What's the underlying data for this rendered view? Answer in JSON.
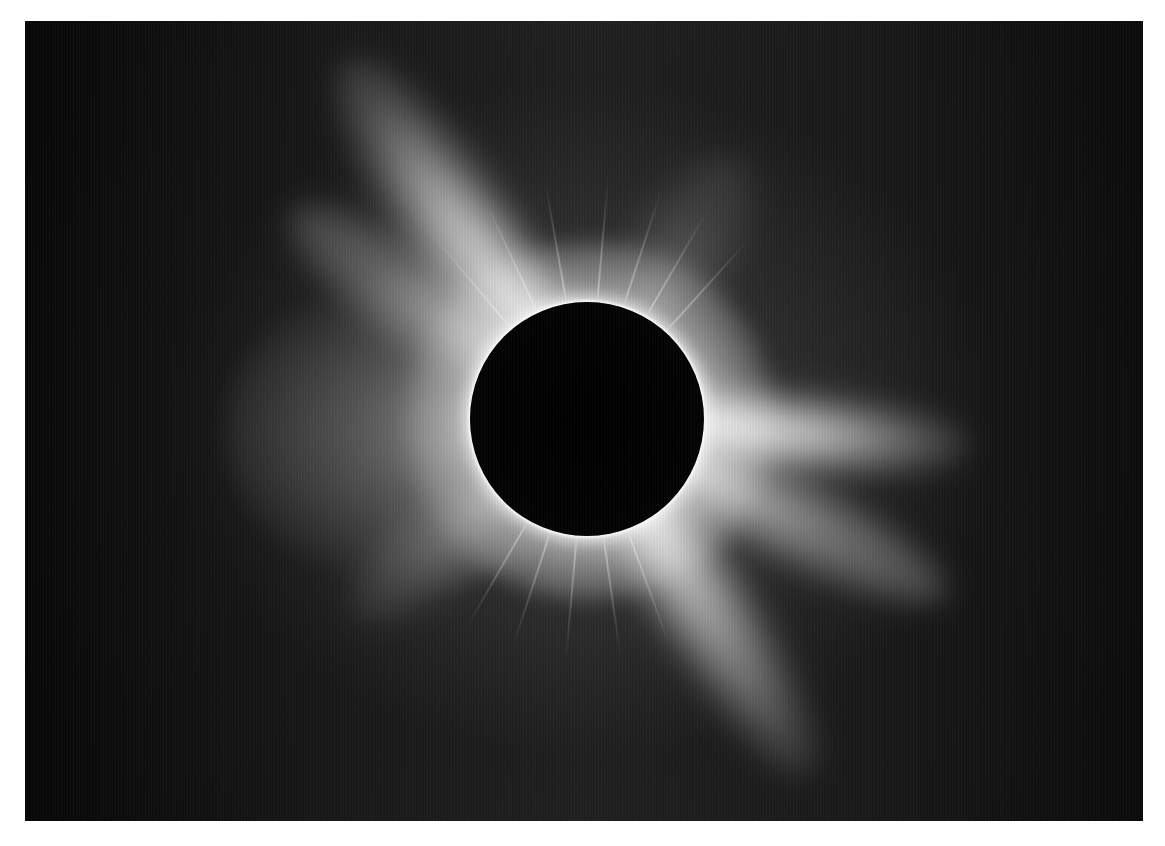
{
  "image": {
    "subject": "Total solar eclipse with white corona streamers around dark lunar disk",
    "background_color": "#0a0a0a",
    "corona_color": "#ffffff",
    "moon_color": "#000000",
    "frame": {
      "x": 25,
      "y": 21,
      "width": 1118,
      "height": 800
    },
    "moon": {
      "cx": 562,
      "cy": 398,
      "r": 117
    }
  }
}
